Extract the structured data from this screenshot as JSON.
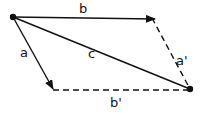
{
  "diagram": {
    "labels": {
      "b": "b",
      "a": "a",
      "c": "c",
      "a_prime": "a'",
      "b_prime": "b'"
    },
    "colors": {
      "stroke": "#111111",
      "background": "#ffffff"
    }
  }
}
